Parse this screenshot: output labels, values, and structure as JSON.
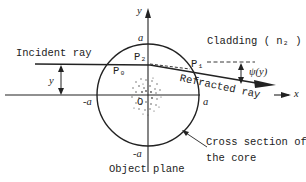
{
  "diagram": {
    "labels": {
      "incident_ray": "Incident ray",
      "refracted_ray": "Refracted ray",
      "cladding": "Cladding ( n₂ )",
      "cross_section_line1": "Cross section of",
      "cross_section_line2": "the core",
      "object_plane": "Object plane",
      "axis_x": "x",
      "axis_y": "y",
      "origin": "O",
      "a_top": "a",
      "a_bottom": "-a",
      "a_left": "-a",
      "a_right": "a",
      "p0": "P₀",
      "p1": "P₁",
      "p2": "P₂",
      "y_height": "y",
      "psi": "ψ(y)"
    },
    "colors": {
      "ink": "#222222",
      "background": "#ffffff"
    }
  }
}
